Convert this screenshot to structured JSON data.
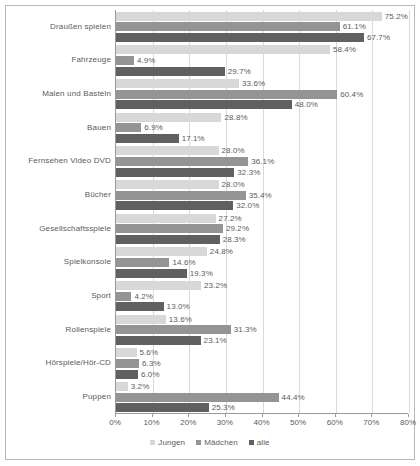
{
  "chart_data": {
    "type": "bar",
    "orientation": "horizontal",
    "title": "",
    "subtitle": "",
    "xlabel": "",
    "ylabel": "",
    "xlim": [
      0,
      80
    ],
    "xtick_step": 10,
    "grid": true,
    "legend_position": "bottom",
    "value_suffix": "%",
    "categories": [
      "Draußen spielen",
      "Fahrzeuge",
      "Malen und Basteln",
      "Bauen",
      "Fernsehen Video DVD",
      "Bücher",
      "Gesellschaftsspiele",
      "Spielkonsole",
      "Sport",
      "Rollenspiele",
      "Hörspiele/Hör-CD",
      "Puppen"
    ],
    "series": [
      {
        "name": "Jungen",
        "color": "#d8d8d8",
        "values": [
          75.2,
          58.4,
          33.6,
          28.8,
          28.0,
          28.0,
          27.2,
          24.8,
          23.2,
          13.6,
          5.6,
          3.2
        ],
        "labels": [
          "75.2%",
          "58.4%",
          "33.6%",
          "28.8%",
          "28.0%",
          "28.0%",
          "27.2%",
          "24.8%",
          "23.2%",
          "13.6%",
          "5.6%",
          "3.2%"
        ]
      },
      {
        "name": "Mädchen",
        "color": "#949494",
        "values": [
          61.1,
          4.9,
          60.4,
          6.9,
          36.1,
          35.4,
          29.2,
          14.6,
          4.2,
          31.3,
          6.3,
          44.4
        ],
        "labels": [
          "61.1%",
          "4.9%",
          "60.4%",
          "6.9%",
          "36.1%",
          "35.4%",
          "29.2%",
          "14.6%",
          "4.2%",
          "31.3%",
          "6.3%",
          "44.4%"
        ]
      },
      {
        "name": "alle",
        "color": "#606060",
        "values": [
          67.7,
          29.7,
          48.0,
          17.1,
          32.3,
          32.0,
          28.3,
          19.3,
          13.0,
          23.1,
          6.0,
          25.3
        ],
        "labels": [
          "67.7%",
          "29.7%",
          "48.0%",
          "17.1%",
          "32.3%",
          "32.0%",
          "28.3%",
          "19.3%",
          "13.0%",
          "23.1%",
          "6.0%",
          "25.3%"
        ]
      }
    ],
    "xticks": [
      0,
      10,
      20,
      30,
      40,
      50,
      60,
      70,
      80
    ],
    "xtick_labels": [
      "0%",
      "10%",
      "20%",
      "30%",
      "40%",
      "50%",
      "60%",
      "70%",
      "80%"
    ]
  },
  "legend": {
    "items": [
      {
        "label": "Jungen",
        "key": "jungen"
      },
      {
        "label": "Mädchen",
        "key": "maedchen"
      },
      {
        "label": "alle",
        "key": "alle"
      }
    ]
  }
}
